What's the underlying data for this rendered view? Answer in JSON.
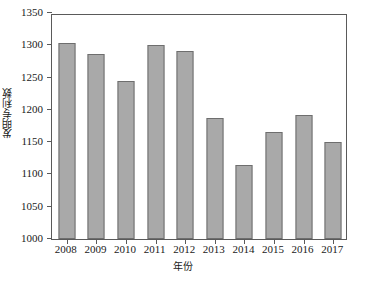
{
  "chart_data": {
    "type": "bar",
    "title": "",
    "subtitle": "",
    "xlabel": "年份",
    "ylabel": "发明专利数",
    "categories": [
      "2008",
      "2009",
      "2010",
      "2011",
      "2012",
      "2013",
      "2014",
      "2015",
      "2016",
      "2017"
    ],
    "values": [
      1303,
      1287,
      1244,
      1300,
      1291,
      1188,
      1115,
      1166,
      1192,
      1151
    ],
    "series": [
      {
        "name": "发明专利数",
        "values": [
          1303,
          1287,
          1244,
          1300,
          1291,
          1188,
          1115,
          1166,
          1192,
          1151
        ]
      }
    ],
    "ylim": [
      1000,
      1350
    ],
    "xlim_categories": 10,
    "y_ticks": [
      1000,
      1050,
      1100,
      1150,
      1200,
      1250,
      1300,
      1350
    ],
    "y_tick_labels": [
      "1000",
      "1050",
      "1100",
      "1150",
      "1200",
      "1250",
      "1300",
      "1350"
    ],
    "x_tick_labels": [
      "2008",
      "2009",
      "2010",
      "2011",
      "2012",
      "2013",
      "2014",
      "2015",
      "2016",
      "2017"
    ],
    "grid": false,
    "legend": false,
    "legend_position": "none",
    "annotations": [],
    "colors": {
      "bar_fill": "#a9a9a9",
      "bar_border": "#6e6e6e",
      "axis": "#5a5a5a",
      "text": "#1a1a1a",
      "background": "#ffffff"
    }
  }
}
